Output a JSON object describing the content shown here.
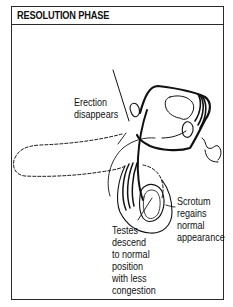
{
  "figure": {
    "title": "RESOLUTION PHASE"
  },
  "labels": {
    "erection": [
      "Erection",
      "disappears"
    ],
    "scrotum": [
      "Scrotum",
      "regains",
      "normal",
      "appearance"
    ],
    "testes": [
      "Testes",
      "descend",
      "to normal",
      "position",
      "with less",
      "congestion"
    ]
  },
  "colors": {
    "ink": "#111111",
    "frame": "#2a2a2a",
    "background": "#ffffff"
  }
}
